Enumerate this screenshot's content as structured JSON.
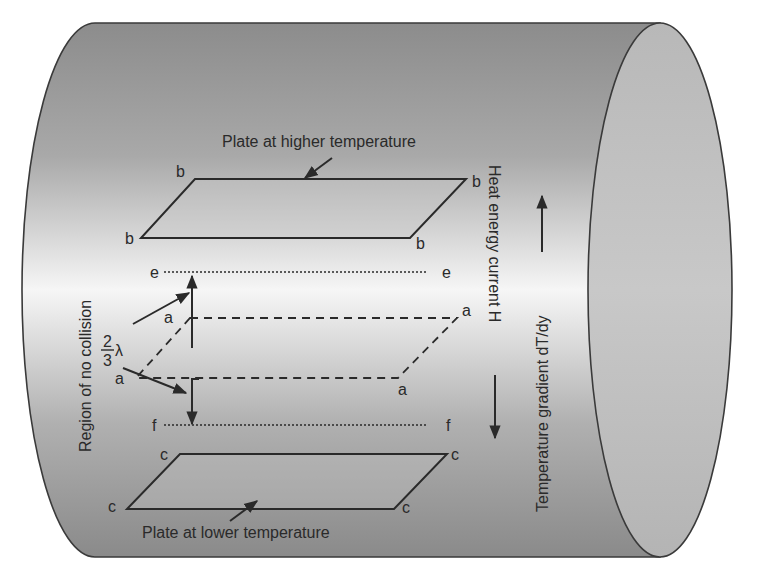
{
  "diagram": {
    "labels": {
      "plate_high": "Plate at higher temperature",
      "plate_low": "Plate at lower temperature",
      "region": "Region of no collision",
      "heat_current": "Heat energy current H",
      "temp_gradient": "Temperature gradient dT/dy",
      "fraction_num": "2",
      "fraction_den": "3",
      "lambda": "λ"
    },
    "points": {
      "b": "b",
      "e": "e",
      "a": "a",
      "f": "f",
      "c": "c"
    },
    "colors": {
      "line": "#2a2a2a",
      "cylinder_dark": "#8a8a8a",
      "cylinder_light": "#f4f4f4",
      "cap": "#bdbdbd",
      "plate_fill": "#cfcfcf"
    }
  }
}
